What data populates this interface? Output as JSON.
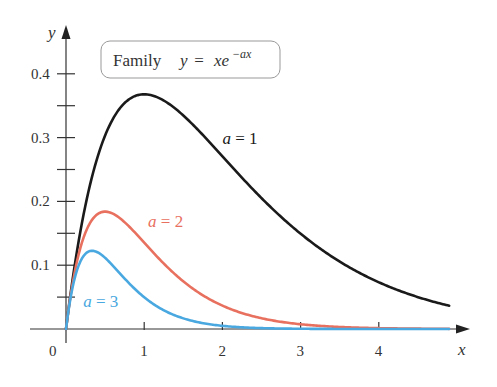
{
  "chart_data": {
    "type": "line",
    "title_parts": {
      "word": "Family",
      "lhs": "y",
      "eq": " = ",
      "rhs": "xe",
      "exp": "−ax"
    },
    "xlabel": "x",
    "ylabel": "y",
    "origin_label": "0",
    "xlim": [
      0,
      5.1
    ],
    "ylim": [
      0,
      0.47
    ],
    "x_ticks": [
      1,
      2,
      3,
      4
    ],
    "x_tick_labels": [
      "1",
      "2",
      "3",
      "4"
    ],
    "y_ticks": [
      0.05,
      0.1,
      0.15,
      0.2,
      0.25,
      0.3,
      0.35,
      0.4
    ],
    "y_tick_labels": [
      {
        "value": 0.1,
        "label": "0.1"
      },
      {
        "value": 0.2,
        "label": "0.2"
      },
      {
        "value": 0.3,
        "label": "0.3"
      },
      {
        "value": 0.4,
        "label": "0.4"
      }
    ],
    "grid": false,
    "x_range_plotted": [
      0,
      4.9
    ],
    "series": [
      {
        "name": "a = 1",
        "a": 1,
        "color": "#1a1a1a",
        "label_at": [
          2.0,
          0.29
        ],
        "x": [
          0,
          0.5,
          1,
          1.5,
          2,
          2.5,
          3,
          3.5,
          4,
          4.5,
          4.9
        ],
        "values": [
          0,
          0.303,
          0.368,
          0.335,
          0.271,
          0.205,
          0.149,
          0.106,
          0.073,
          0.05,
          0.036
        ]
      },
      {
        "name": "a = 2",
        "a": 2,
        "color": "#e8705e",
        "label_at": [
          1.05,
          0.16
        ],
        "x": [
          0,
          0.25,
          0.5,
          0.75,
          1,
          1.5,
          2,
          2.5,
          3,
          4,
          4.9
        ],
        "values": [
          0,
          0.152,
          0.184,
          0.167,
          0.135,
          0.075,
          0.037,
          0.017,
          0.007,
          0.001,
          0.0003
        ]
      },
      {
        "name": "a = 3",
        "a": 3,
        "color": "#4aa8e0",
        "label_at": [
          0.22,
          0.035
        ],
        "x": [
          0,
          0.2,
          0.333,
          0.5,
          0.75,
          1,
          1.5,
          2,
          3,
          4.9
        ],
        "values": [
          0,
          0.11,
          0.123,
          0.112,
          0.079,
          0.05,
          0.017,
          0.005,
          0.0004,
          0
        ]
      }
    ],
    "axis_color": "#333333",
    "legend": {
      "position": "top-left boxed title"
    }
  }
}
